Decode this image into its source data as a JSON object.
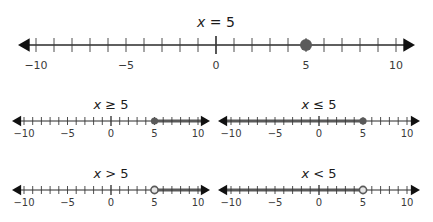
{
  "colors": {
    "axis": "#2a2a2a",
    "tick": "#3a3a3a",
    "highlight": "#5a5a5a",
    "open_fill": "#e6e6e6"
  },
  "number_lines": [
    {
      "title_var": "x",
      "title_rest": " = 5",
      "relation": "=",
      "value": 5,
      "point": "closed",
      "shade": "none",
      "tick_labels": [
        "−10",
        "−5",
        "0",
        "5",
        "10"
      ]
    },
    {
      "title_var": "x",
      "title_rest": " ≥ 5",
      "relation": "≥",
      "value": 5,
      "point": "closed",
      "shade": "right",
      "tick_labels": [
        "−10",
        "−5",
        "0",
        "5",
        "10"
      ]
    },
    {
      "title_var": "x",
      "title_rest": " ≤ 5",
      "relation": "≤",
      "value": 5,
      "point": "closed",
      "shade": "left",
      "tick_labels": [
        "−10",
        "−5",
        "0",
        "5",
        "10"
      ]
    },
    {
      "title_var": "x",
      "title_rest": " > 5",
      "relation": ">",
      "value": 5,
      "point": "open",
      "shade": "right",
      "tick_labels": [
        "−10",
        "−5",
        "0",
        "5",
        "10"
      ]
    },
    {
      "title_var": "x",
      "title_rest": " < 5",
      "relation": "<",
      "value": 5,
      "point": "open",
      "shade": "left",
      "tick_labels": [
        "−10",
        "−5",
        "0",
        "5",
        "10"
      ]
    }
  ]
}
